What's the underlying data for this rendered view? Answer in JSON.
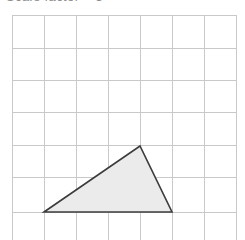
{
  "canvas": {
    "width": 245,
    "height": 240,
    "background_color": "#ffffff"
  },
  "caption": {
    "text": "Scale factor = 3",
    "note_visible": "clipped at top edge, only descender pixels visible",
    "color": "#8d8d8d"
  },
  "grid": {
    "line_color": "#c9c9c9",
    "line_width": 1,
    "cell_size": 32.3,
    "origin_x": 12,
    "origin_y": 15,
    "vertical_lines_x": [
      12,
      44,
      76,
      108,
      140,
      172,
      204,
      236
    ],
    "horizontal_lines_y": [
      15,
      48,
      80,
      112,
      145,
      177,
      212,
      244
    ],
    "columns": 7,
    "rows": 7
  },
  "shape": {
    "name": "triangle",
    "fill_color": "#ebebeb",
    "stroke_color": "#3c3c3c",
    "stroke_width": 1.6,
    "points_px": "44,212 140,146 172,212",
    "vertices_px": [
      {
        "label": "bottom-left",
        "x": 44,
        "y": 212
      },
      {
        "label": "apex",
        "x": 140,
        "y": 146
      },
      {
        "label": "bottom-right",
        "x": 172,
        "y": 212
      }
    ],
    "vertices_grid_units": [
      {
        "label": "bottom-left",
        "col": 1,
        "row": 6
      },
      {
        "label": "apex",
        "col": 4,
        "row": 4
      },
      {
        "label": "bottom-right",
        "col": 5,
        "row": 6
      }
    ],
    "base_length_cells": 4,
    "height_cells": 2
  }
}
